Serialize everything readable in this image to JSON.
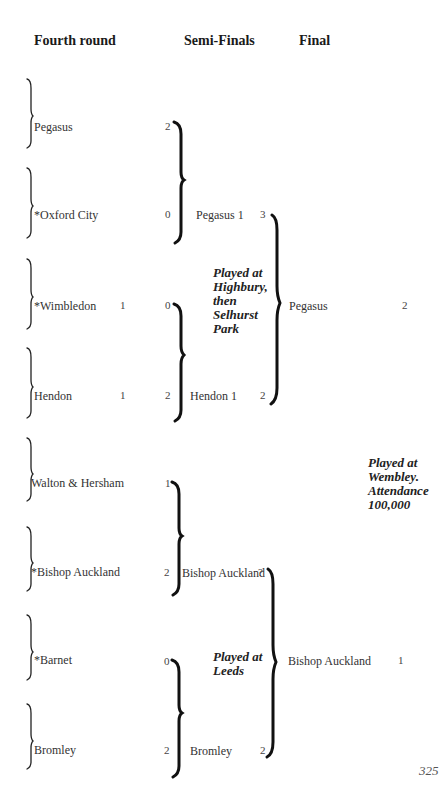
{
  "headers": {
    "fourth_round": "Fourth round",
    "semi_finals": "Semi-Finals",
    "final": "Final"
  },
  "fourth_round": [
    {
      "team": "Pegasus",
      "score": "",
      "semi_score": "2"
    },
    {
      "team": "*Oxford City",
      "score": "",
      "semi_score": "0"
    },
    {
      "team": "*Wimbledon",
      "score": "1",
      "semi_score": "0"
    },
    {
      "team": "Hendon",
      "score": "1",
      "semi_score": "2"
    },
    {
      "team": "Walton & Hersham",
      "score": "",
      "semi_score": "1"
    },
    {
      "team": "*Bishop Auckland",
      "score": "",
      "semi_score": "2"
    },
    {
      "team": "*Barnet",
      "score": "",
      "semi_score": "0"
    },
    {
      "team": "Bromley",
      "score": "",
      "semi_score": "2"
    }
  ],
  "semi_finals": [
    {
      "team": "Pegasus 1",
      "score": "3"
    },
    {
      "team": "Hendon 1",
      "score": "2"
    },
    {
      "team": "Bishop Auckland",
      "score": "?"
    },
    {
      "team": "Bromley",
      "score": "2"
    }
  ],
  "semi_notes": {
    "top": "Played at Highbury, then Selhurst Park",
    "bottom": "Played at Leeds"
  },
  "final": [
    {
      "team": "Pegasus",
      "score": "2"
    },
    {
      "team": "Bishop Auckland",
      "score": "1"
    }
  ],
  "final_note": "Played at Wembley. Attendance 100,000",
  "page_number": "325"
}
